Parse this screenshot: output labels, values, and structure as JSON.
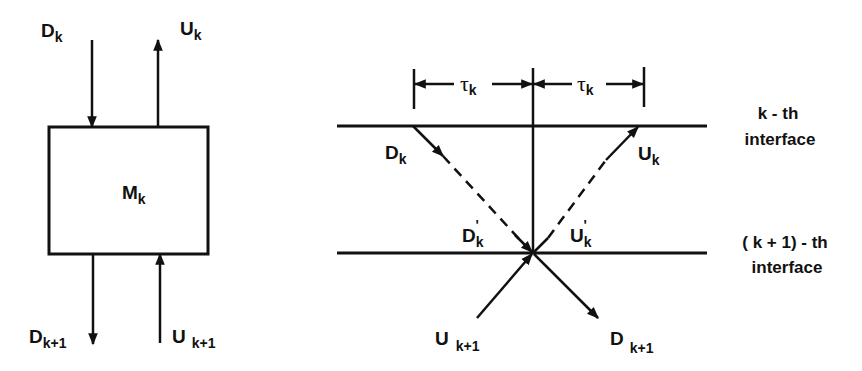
{
  "left_diagram": {
    "block_label": "M",
    "block_sub": "k",
    "top_in": {
      "main": "D",
      "sub": "k"
    },
    "top_out": {
      "main": "U",
      "sub": "k"
    },
    "bottom_out": {
      "main": "D",
      "sub": "k+1"
    },
    "bottom_in": {
      "main": "U",
      "sub": "k+1"
    }
  },
  "right_diagram": {
    "tau_left": {
      "main": "τ",
      "sub": "k"
    },
    "tau_right": {
      "main": "τ",
      "sub": "k"
    },
    "d_in": {
      "main": "D",
      "sub": "k"
    },
    "u_out": {
      "main": "U",
      "sub": "k"
    },
    "d_prime": {
      "main": "D",
      "sub": "k",
      "prime": "'"
    },
    "u_prime": {
      "main": "U",
      "sub": "k",
      "prime": "'"
    },
    "u_in": {
      "main": "U",
      "sub": "k+1"
    },
    "d_out": {
      "main": "D",
      "sub": "k+1"
    },
    "interface_top": {
      "line1": "k -  th",
      "line2": "interface"
    },
    "interface_bottom": {
      "line1": "( k + 1)  -  th",
      "line2": "interface"
    }
  },
  "colors": {
    "stroke": "#111111",
    "background": "#ffffff"
  }
}
